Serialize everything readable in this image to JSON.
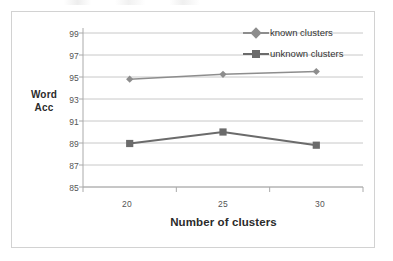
{
  "figure": {
    "background_color": "#ffffff",
    "border_color": "#d2d2d2"
  },
  "chart_data": {
    "type": "line",
    "title": "",
    "xlabel": "Number of clusters",
    "ylabel": "Word Acc",
    "ylabel_lines": [
      "Word",
      "Acc"
    ],
    "categories": [
      "20",
      "25",
      "30"
    ],
    "x": [
      20,
      25,
      30
    ],
    "ylim": [
      85,
      99
    ],
    "yticks": [
      85,
      87,
      89,
      91,
      93,
      95,
      97,
      99
    ],
    "ytick_labels": [
      "85",
      "87",
      "89",
      "91",
      "93",
      "95",
      "97",
      "99"
    ],
    "xtick_labels": [
      "20",
      "25",
      "30"
    ],
    "grid": "horizontal",
    "legend_position": "top-right",
    "series": [
      {
        "name": "known clusters",
        "values": [
          94.8,
          95.25,
          95.5
        ],
        "marker": "diamond",
        "color": "#8d8d8d"
      },
      {
        "name": "unknown clusters",
        "values": [
          88.95,
          90.0,
          88.8
        ],
        "marker": "square",
        "color": "#6b6b6b"
      }
    ],
    "legend": [
      "known clusters",
      "unknown clusters"
    ]
  }
}
